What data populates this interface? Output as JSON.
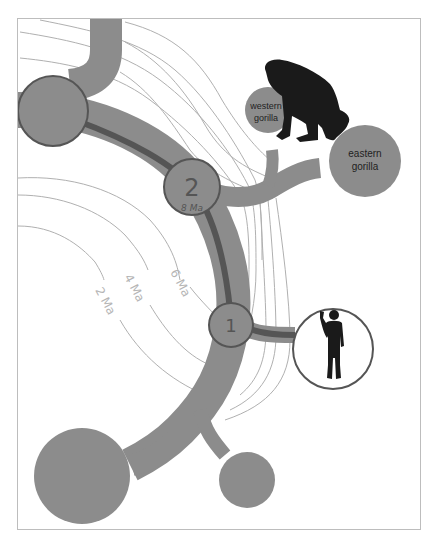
{
  "diagram": {
    "type": "phylogenetic-tree",
    "colors": {
      "branch": "#8c8c8c",
      "lineage_dark": "#555555",
      "contour": "#b0b0b0",
      "node_outline": "#555555",
      "silhouette": "#1a1a1a",
      "frame": "#bdbdbd",
      "background": "#ffffff",
      "time_label": "#b5b5b5"
    },
    "nodes": {
      "node_2": {
        "number": "2",
        "age": "8 Ma"
      },
      "node_1": {
        "number": "1"
      }
    },
    "taxa": {
      "western_gorilla": {
        "line1": "western",
        "line2": "gorilla"
      },
      "eastern_gorilla": {
        "line1": "eastern",
        "line2": "gorilla"
      },
      "human": {
        "silhouette": "human-silhouette-icon"
      },
      "gorilla": {
        "silhouette": "gorilla-silhouette-icon"
      }
    },
    "time_contours": [
      {
        "label": "6 Ma"
      },
      {
        "label": "4 Ma"
      },
      {
        "label": "2 Ma"
      }
    ]
  }
}
